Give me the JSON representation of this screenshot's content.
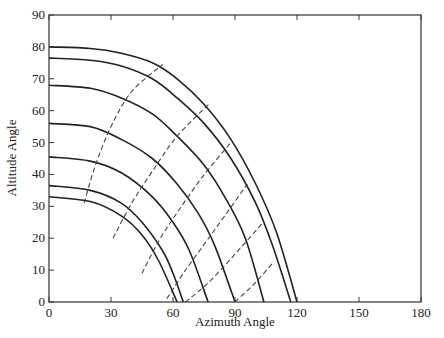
{
  "chart_data": {
    "type": "line",
    "title": "",
    "xlabel": "Azimuth Angle",
    "ylabel": "Altitude Angle",
    "xlim": [
      0,
      180
    ],
    "ylim": [
      0,
      90
    ],
    "xticks": [
      0,
      30,
      60,
      90,
      120,
      150,
      180
    ],
    "yticks": [
      0,
      10,
      20,
      30,
      40,
      50,
      60,
      70,
      80,
      90
    ],
    "grid": false,
    "legend": null,
    "series": [
      {
        "name": "sun path 1",
        "style": "solid",
        "points": [
          [
            0,
            80
          ],
          [
            20,
            79.5
          ],
          [
            35,
            78
          ],
          [
            50,
            75
          ],
          [
            62,
            70
          ],
          [
            75,
            62
          ],
          [
            88,
            51
          ],
          [
            100,
            37
          ],
          [
            110,
            22
          ],
          [
            120,
            0
          ]
        ]
      },
      {
        "name": "sun path 2",
        "style": "solid",
        "points": [
          [
            0,
            76.5
          ],
          [
            20,
            75.8
          ],
          [
            35,
            74
          ],
          [
            50,
            70
          ],
          [
            62,
            64
          ],
          [
            75,
            56
          ],
          [
            88,
            45
          ],
          [
            100,
            31
          ],
          [
            108,
            18
          ],
          [
            117,
            0
          ]
        ]
      },
      {
        "name": "sun path 3",
        "style": "solid",
        "points": [
          [
            0,
            68
          ],
          [
            20,
            67
          ],
          [
            35,
            64
          ],
          [
            50,
            59
          ],
          [
            62,
            52
          ],
          [
            75,
            43
          ],
          [
            85,
            33
          ],
          [
            95,
            20
          ],
          [
            104,
            0
          ]
        ]
      },
      {
        "name": "sun path 4",
        "style": "solid",
        "points": [
          [
            0,
            56
          ],
          [
            20,
            55
          ],
          [
            35,
            51
          ],
          [
            50,
            45
          ],
          [
            62,
            37
          ],
          [
            72,
            28
          ],
          [
            80,
            18
          ],
          [
            90,
            0
          ]
        ]
      },
      {
        "name": "sun path 5",
        "style": "solid",
        "points": [
          [
            0,
            45.5
          ],
          [
            20,
            44.2
          ],
          [
            35,
            40.5
          ],
          [
            50,
            33
          ],
          [
            60,
            25
          ],
          [
            68,
            16
          ],
          [
            77,
            0
          ]
        ]
      },
      {
        "name": "sun path 6",
        "style": "solid",
        "points": [
          [
            0,
            36.5
          ],
          [
            20,
            35
          ],
          [
            35,
            31
          ],
          [
            45,
            25
          ],
          [
            55,
            16
          ],
          [
            60,
            9
          ],
          [
            65,
            0
          ]
        ]
      },
      {
        "name": "sun path 7",
        "style": "solid",
        "points": [
          [
            0,
            33
          ],
          [
            20,
            31.5
          ],
          [
            35,
            27
          ],
          [
            45,
            21
          ],
          [
            53,
            13
          ],
          [
            62,
            0
          ]
        ]
      },
      {
        "name": "hour line 1",
        "style": "dashed",
        "points": [
          [
            17,
            31
          ],
          [
            22,
            42
          ],
          [
            30,
            55
          ],
          [
            40,
            66
          ],
          [
            55,
            74.5
          ]
        ]
      },
      {
        "name": "hour line 2",
        "style": "dashed",
        "points": [
          [
            31,
            20
          ],
          [
            40,
            31
          ],
          [
            50,
            41
          ],
          [
            62,
            52
          ],
          [
            78,
            62.5
          ]
        ]
      },
      {
        "name": "hour line 3",
        "style": "dashed",
        "points": [
          [
            45,
            9
          ],
          [
            53,
            19
          ],
          [
            62,
            28
          ],
          [
            74,
            39
          ],
          [
            88,
            50
          ]
        ]
      },
      {
        "name": "hour line 4",
        "style": "dashed",
        "points": [
          [
            57,
            1
          ],
          [
            65,
            9
          ],
          [
            75,
            18
          ],
          [
            85,
            27
          ],
          [
            96,
            37
          ]
        ]
      },
      {
        "name": "hour line 5",
        "style": "dashed",
        "points": [
          [
            66,
            0
          ],
          [
            77,
            6
          ],
          [
            90,
            15
          ],
          [
            103,
            24.5
          ]
        ]
      },
      {
        "name": "hour line 6",
        "style": "dashed",
        "points": [
          [
            90,
            0
          ],
          [
            99,
            5.5
          ],
          [
            108,
            12
          ]
        ]
      }
    ]
  }
}
